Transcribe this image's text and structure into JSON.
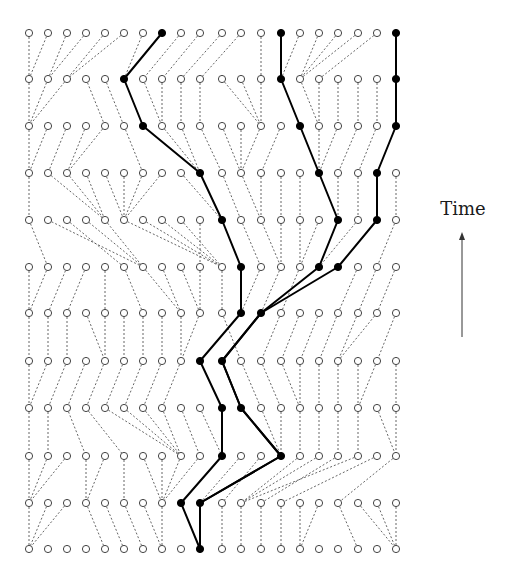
{
  "labels": {
    "time": "Time"
  },
  "grid": {
    "columns_x": [
      29,
      48,
      67,
      86,
      105,
      124,
      143,
      162,
      181,
      200,
      222,
      241,
      261,
      281,
      300,
      319,
      338,
      358,
      377,
      396
    ],
    "rows_y": [
      33,
      79,
      126,
      173,
      220,
      267,
      313,
      361,
      408,
      456,
      503,
      549
    ],
    "node_radius": 3.6
  },
  "colors": {
    "edge": "#555555",
    "bold": "#000000",
    "node_stroke": "#444444",
    "node_fill": "#ffffff"
  },
  "parents": [
    [
      0,
      0,
      1,
      1,
      2,
      2,
      5,
      5,
      6,
      7,
      8,
      9,
      12,
      13,
      13,
      14,
      14,
      14,
      15,
      19
    ],
    [
      0,
      0,
      0,
      4,
      5,
      6,
      7,
      7,
      8,
      9,
      12,
      12,
      12,
      14,
      15,
      15,
      16,
      17,
      18,
      19
    ],
    [
      0,
      0,
      1,
      2,
      2,
      6,
      9,
      9,
      9,
      10,
      11,
      11,
      11,
      12,
      15,
      15,
      15,
      16,
      17,
      18
    ],
    [
      0,
      4,
      4,
      4,
      5,
      5,
      5,
      5,
      10,
      10,
      11,
      12,
      12,
      13,
      14,
      16,
      16,
      17,
      18,
      19
    ],
    [
      1,
      6,
      5,
      6,
      6,
      10,
      10,
      10,
      10,
      9,
      11,
      12,
      13,
      13,
      14,
      14,
      15,
      15,
      16,
      18
    ],
    [
      0,
      0,
      1,
      2,
      4,
      6,
      8,
      8,
      9,
      9,
      10,
      11,
      11,
      12,
      13,
      12,
      12,
      16,
      17,
      18
    ],
    [
      0,
      1,
      2,
      4,
      4,
      5,
      6,
      7,
      8,
      8,
      11,
      9,
      10,
      12,
      13,
      14,
      15,
      16,
      16,
      18
    ],
    [
      0,
      0,
      1,
      2,
      3,
      4,
      5,
      6,
      7,
      10,
      11,
      12,
      13,
      14,
      14,
      15,
      16,
      17,
      17,
      19
    ],
    [
      0,
      1,
      3,
      5,
      8,
      8,
      8,
      8,
      9,
      10,
      10,
      13,
      13,
      13,
      14,
      15,
      16,
      17,
      19,
      19
    ],
    [
      0,
      0,
      0,
      3,
      3,
      5,
      7,
      7,
      7,
      7,
      8,
      9,
      10,
      9,
      11,
      11,
      12,
      11,
      13,
      16
    ],
    [
      0,
      0,
      0,
      4,
      5,
      6,
      7,
      7,
      9,
      9,
      10,
      11,
      12,
      13,
      14,
      14,
      17,
      19,
      19,
      19
    ]
  ],
  "bold_lineages": [
    [
      7,
      5,
      6,
      9,
      10,
      11,
      11,
      9,
      10,
      10,
      8,
      9
    ],
    [
      13,
      13,
      14,
      15,
      16,
      15,
      12,
      10,
      11,
      13,
      9,
      9
    ],
    [
      19,
      19,
      19,
      18,
      18,
      16,
      12,
      10,
      11,
      13,
      9,
      9
    ]
  ],
  "arrow": {
    "x": 462,
    "y_start": 337,
    "y_end": 233
  }
}
